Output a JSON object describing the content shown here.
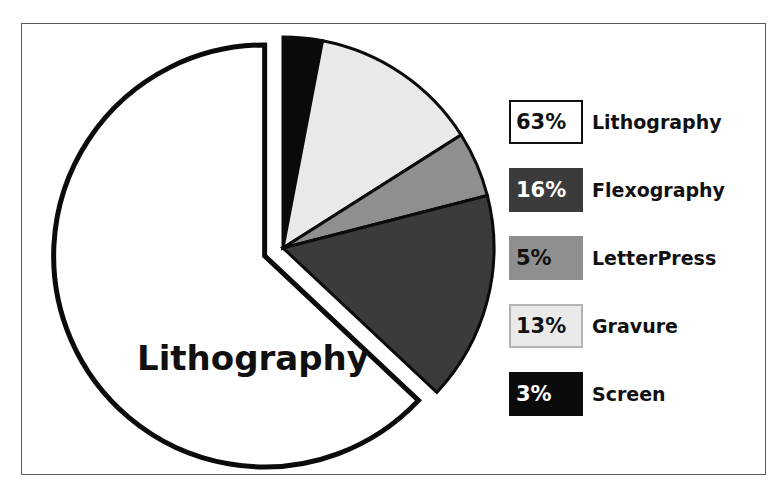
{
  "figure": {
    "center_label": "Lithography",
    "frame_color": "#5a5a5a",
    "background": "#ffffff"
  },
  "chart_data": {
    "type": "pie",
    "title": "",
    "subtitle": "",
    "xlabel": "",
    "ylabel": "",
    "legend_position": "right",
    "grid": false,
    "units": "percent",
    "total": 100,
    "center_annotation": "Lithography",
    "exploded_slice": "Lithography",
    "start_angle_deg": 0,
    "direction": "clockwise",
    "categories": [
      "Lithography",
      "Flexography",
      "LetterPress",
      "Gravure",
      "Screen"
    ],
    "values": [
      63,
      16,
      5,
      13,
      3
    ],
    "labels": [
      "63%",
      "16%",
      "5%",
      "13%",
      "3%"
    ],
    "colors": [
      "#ffffff",
      "#3b3b3b",
      "#8f8f8f",
      "#e9e9e9",
      "#0b0b0b"
    ],
    "slices": [
      {
        "name": "Lithography",
        "value": 63,
        "label": "63%",
        "fill": "#ffffff",
        "stroke": "#0b0b0b",
        "text_color": "#111111",
        "exploded": true
      },
      {
        "name": "Flexography",
        "value": 16,
        "label": "16%",
        "fill": "#3b3b3b",
        "stroke": "#0b0b0b",
        "text_color": "#ffffff",
        "exploded": false
      },
      {
        "name": "LetterPress",
        "value": 5,
        "label": "5%",
        "fill": "#8f8f8f",
        "stroke": "#0b0b0b",
        "text_color": "#111111",
        "exploded": false
      },
      {
        "name": "Gravure",
        "value": 13,
        "label": "13%",
        "fill": "#e9e9e9",
        "stroke": "#0b0b0b",
        "text_color": "#111111",
        "exploded": false
      },
      {
        "name": "Screen",
        "value": 3,
        "label": "3%",
        "fill": "#0b0b0b",
        "stroke": "#0b0b0b",
        "text_color": "#ffffff",
        "exploded": false
      }
    ]
  },
  "legend": {
    "rows": [
      {
        "percent": "63%",
        "name": "Lithography",
        "swatch": "#ffffff",
        "border": "#111111",
        "pct_color": "#111111"
      },
      {
        "percent": "16%",
        "name": "Flexography",
        "swatch": "#3b3b3b",
        "border": "#3b3b3b",
        "pct_color": "#ffffff"
      },
      {
        "percent": "5%",
        "name": "LetterPress",
        "swatch": "#8f8f8f",
        "border": "#8f8f8f",
        "pct_color": "#111111"
      },
      {
        "percent": "13%",
        "name": "Gravure",
        "swatch": "#e9e9e9",
        "border": "#b4b4b4",
        "pct_color": "#111111"
      },
      {
        "percent": "3%",
        "name": "Screen",
        "swatch": "#0b0b0b",
        "border": "#0b0b0b",
        "pct_color": "#ffffff"
      }
    ]
  }
}
